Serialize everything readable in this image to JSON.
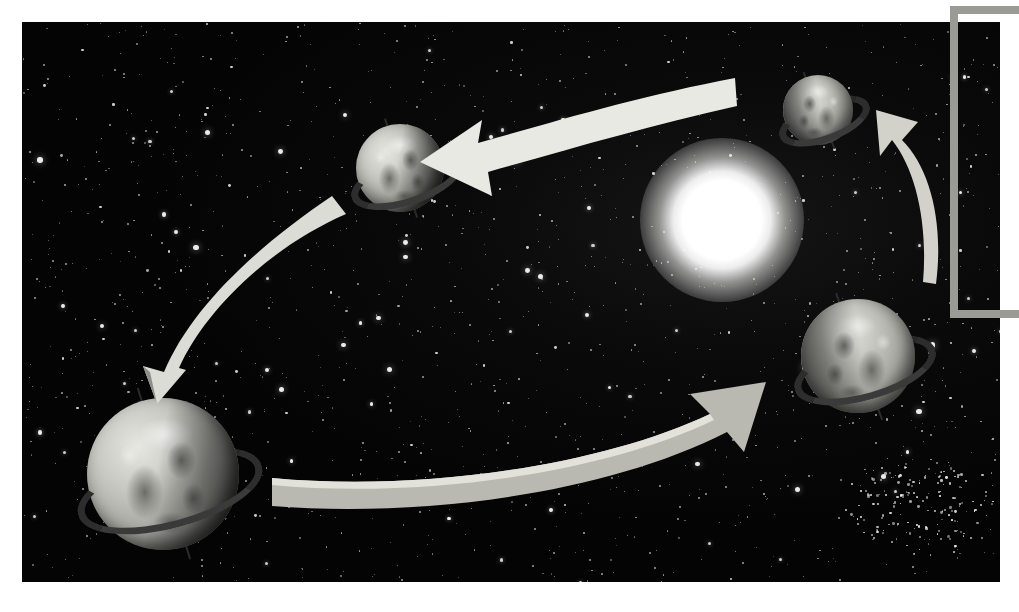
{
  "figure": {
    "kind": "astronomy-diagram",
    "background_color": "#050506",
    "plate": {
      "x": 22,
      "y": 22,
      "width": 978,
      "height": 560
    }
  },
  "sun": {
    "label": "sun",
    "center_x": 722,
    "center_y": 220,
    "core_radius": 42,
    "glow_radius": 82,
    "color": "#ffffff"
  },
  "globes": [
    {
      "name": "earth-top-right",
      "label": "Earth",
      "center_x": 818,
      "center_y": 110,
      "radius": 35,
      "axis_tilt_deg": -22,
      "ring_tilt_deg": -20,
      "lit_side": "left"
    },
    {
      "name": "earth-right",
      "label": "Earth",
      "center_x": 858,
      "center_y": 356,
      "radius": 57,
      "axis_tilt_deg": -20,
      "ring_tilt_deg": -16,
      "lit_side": "left"
    },
    {
      "name": "earth-top-left",
      "label": "Earth",
      "center_x": 400,
      "center_y": 168,
      "radius": 44,
      "axis_tilt_deg": -18,
      "ring_tilt_deg": -18,
      "lit_side": "right"
    },
    {
      "name": "earth-bottom-left",
      "label": "Earth",
      "center_x": 163,
      "center_y": 474,
      "radius": 76,
      "axis_tilt_deg": -17,
      "ring_tilt_deg": -15,
      "lit_side": "right"
    }
  ],
  "arrows": [
    {
      "name": "arrow-top",
      "direction": "left",
      "color": "#e9e9e4",
      "from_x": 735,
      "from_y": 100,
      "to_x": 445,
      "to_y": 160
    },
    {
      "name": "arrow-left",
      "direction": "down-left",
      "color": "#dcdcd6",
      "from_x": 332,
      "from_y": 205,
      "to_x": 156,
      "to_y": 390
    },
    {
      "name": "arrow-bottom",
      "direction": "right",
      "color": "#b9b9b2",
      "from_x": 280,
      "from_y": 494,
      "to_x": 758,
      "to_y": 400
    },
    {
      "name": "arrow-right",
      "direction": "up-left",
      "color": "#d2d2cb",
      "from_x": 938,
      "from_y": 285,
      "to_x": 890,
      "to_y": 122
    }
  ],
  "bracket": {
    "name": "callout-bracket",
    "color": "#9a9a96",
    "x": 950,
    "y": 6,
    "width": 69,
    "height": 312,
    "thickness": 8,
    "opens": "right"
  },
  "star_cluster": {
    "name": "star-cluster",
    "center_x": 920,
    "center_y": 505,
    "radius": 62,
    "count": 170
  }
}
